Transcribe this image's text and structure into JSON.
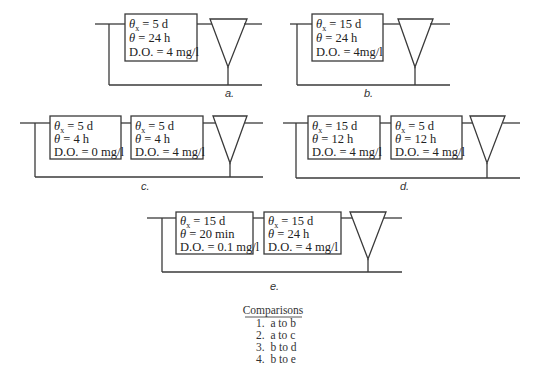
{
  "diagrams": {
    "a": {
      "label": "a.",
      "reactors": [
        {
          "theta_x_sym": "θ",
          "theta_x_sub": "x",
          "theta_x_val": " = 5 d",
          "theta_sym": "θ",
          "theta_val": " = 24 h",
          "do": "D.O. = 4 mg/l"
        }
      ]
    },
    "b": {
      "label": "b.",
      "reactors": [
        {
          "theta_x_sym": "θ",
          "theta_x_sub": "x",
          "theta_x_val": " = 15 d",
          "theta_sym": "θ",
          "theta_val": " = 24 h",
          "do": "D.O. = 4mg/l"
        }
      ]
    },
    "c": {
      "label": "c.",
      "reactors": [
        {
          "theta_x_sym": "θ",
          "theta_x_sub": "x",
          "theta_x_val": " = 5 d",
          "theta_sym": "θ",
          "theta_val": " = 4 h",
          "do": "D.O. = 0 mg/l"
        },
        {
          "theta_x_sym": "θ",
          "theta_x_sub": "x",
          "theta_x_val": " = 5 d",
          "theta_sym": "θ",
          "theta_val": " = 4 h",
          "do": "D.O. = 4 mg/l"
        }
      ]
    },
    "d": {
      "label": "d.",
      "reactors": [
        {
          "theta_x_sym": "θ",
          "theta_x_sub": "x",
          "theta_x_val": " = 15 d",
          "theta_sym": "θ",
          "theta_val": " = 12 h",
          "do": "D.O. = 4 mg/l"
        },
        {
          "theta_x_sym": "θ",
          "theta_x_sub": "x",
          "theta_x_val": " = 5 d",
          "theta_sym": "θ",
          "theta_val": " = 12 h",
          "do": "D.O. = 4 mg/l"
        }
      ]
    },
    "e": {
      "label": "e.",
      "reactors": [
        {
          "theta_x_sym": "θ",
          "theta_x_sub": "x",
          "theta_x_val": " = 15 d",
          "theta_sym": "θ",
          "theta_val": " = 20 min",
          "do": "D.O. = 0.1 mg/l"
        },
        {
          "theta_x_sym": "θ",
          "theta_x_sub": "x",
          "theta_x_val": " = 15 d",
          "theta_sym": "θ",
          "theta_val": " = 24 h",
          "do": "D.O. = 4 mg/l"
        }
      ]
    }
  },
  "comparisons": {
    "title": "Comparisons",
    "items": [
      "1.  a to b",
      "2.  a to c",
      "3.  b to d",
      "4.  b to e"
    ]
  }
}
